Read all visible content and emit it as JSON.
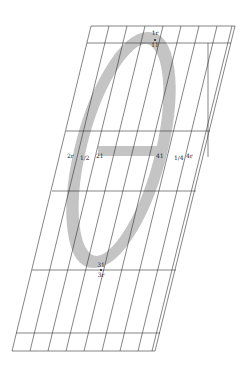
{
  "diagram": {
    "glyph": "θ",
    "colors": {
      "background": "#ffffff",
      "grid_line": "#333333",
      "stroke_fill": "#c4c4c4"
    },
    "labels": {
      "top_upper": "1r",
      "top_lower": "11",
      "left_outer": "2r",
      "left_frac": "1/2",
      "left_inner": "21",
      "right_inner": "41",
      "right_frac": "1/4",
      "right_outer": "4r",
      "bottom_upper": "31",
      "bottom_lower": "3r"
    }
  }
}
